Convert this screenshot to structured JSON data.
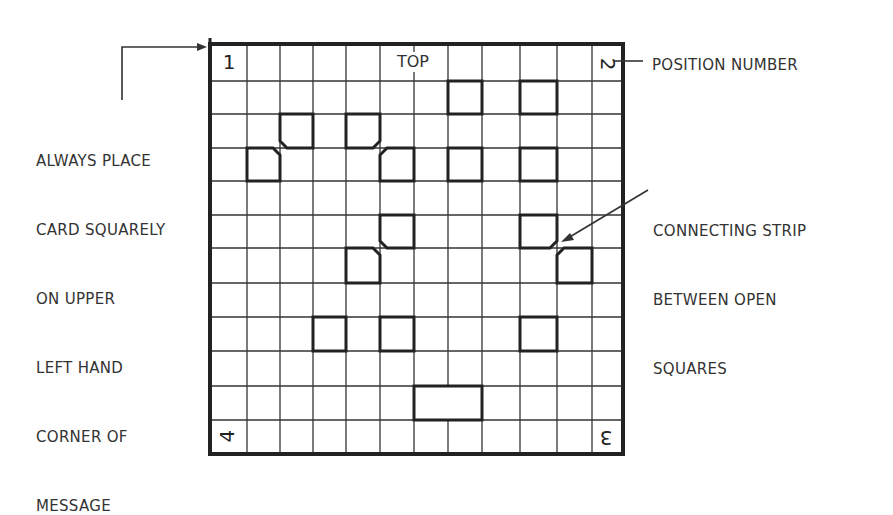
{
  "diagram": {
    "title_top": "TOP",
    "grid": {
      "columns": 12,
      "rows": 12
    },
    "position_numbers": {
      "top_left": "1",
      "top_right": "2",
      "bottom_right": "3",
      "bottom_left": "4"
    },
    "open_squares": [
      {
        "row": 1,
        "col": 7,
        "span": 1,
        "chamfer": null
      },
      {
        "row": 1,
        "col": 9,
        "span": 1,
        "chamfer": null
      },
      {
        "row": 2,
        "col": 2,
        "span": 1,
        "chamfer": "bottom-left"
      },
      {
        "row": 2,
        "col": 4,
        "span": 1,
        "chamfer": "bottom-right"
      },
      {
        "row": 3,
        "col": 1,
        "span": 1,
        "chamfer": "top-right"
      },
      {
        "row": 3,
        "col": 5,
        "span": 1,
        "chamfer": "top-left"
      },
      {
        "row": 3,
        "col": 7,
        "span": 1,
        "chamfer": null
      },
      {
        "row": 3,
        "col": 9,
        "span": 1,
        "chamfer": null
      },
      {
        "row": 5,
        "col": 5,
        "span": 1,
        "chamfer": "bottom-left"
      },
      {
        "row": 5,
        "col": 9,
        "span": 1,
        "chamfer": "bottom-right"
      },
      {
        "row": 6,
        "col": 4,
        "span": 1,
        "chamfer": "top-right"
      },
      {
        "row": 6,
        "col": 10,
        "span": 1,
        "chamfer": "top-left"
      },
      {
        "row": 8,
        "col": 3,
        "span": 1,
        "chamfer": null
      },
      {
        "row": 8,
        "col": 5,
        "span": 1,
        "chamfer": null
      },
      {
        "row": 8,
        "col": 9,
        "span": 1,
        "chamfer": null
      },
      {
        "row": 10,
        "col": 6,
        "span": 2,
        "chamfer": null
      }
    ]
  },
  "annotations": {
    "left_note": [
      "ALWAYS PLACE",
      "CARD SQUARELY",
      "ON UPPER",
      "LEFT HAND",
      "CORNER OF",
      "MESSAGE"
    ],
    "position_label": "POSITION NUMBER",
    "strip_note": [
      "CONNECTING STRIP",
      "BETWEEN OPEN",
      "SQUARES"
    ]
  },
  "colors": {
    "ink": "#222222",
    "text": "#333333",
    "background": "#ffffff"
  }
}
